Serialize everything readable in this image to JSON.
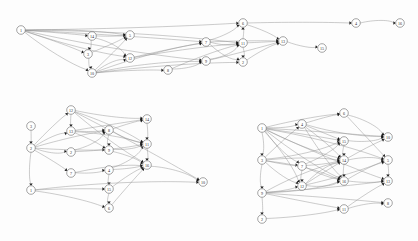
{
  "figure": {
    "background_color": "#fdfdfd",
    "node_fill": "#ffffff",
    "node_stroke": "#4a4a4a",
    "edge_color": "#8d8d8d",
    "arrowhead_color": "#1a1a1a",
    "label_color": "#2b2b2b"
  },
  "graphs": [
    {
      "id": "graph-top",
      "name": "top-graph",
      "nodes": [
        {
          "id": "t1",
          "label": "1",
          "x": 21,
          "y": 30
        },
        {
          "id": "t14",
          "label": "14",
          "x": 92,
          "y": 36
        },
        {
          "id": "t5",
          "label": "5",
          "x": 130,
          "y": 35
        },
        {
          "id": "t3",
          "label": "3",
          "x": 88,
          "y": 54
        },
        {
          "id": "t10",
          "label": "10",
          "x": 92,
          "y": 73
        },
        {
          "id": "t12",
          "label": "12",
          "x": 130,
          "y": 58
        },
        {
          "id": "t8",
          "label": "8",
          "x": 168,
          "y": 70
        },
        {
          "id": "t9",
          "label": "9",
          "x": 206,
          "y": 61
        },
        {
          "id": "t7",
          "label": "7",
          "x": 206,
          "y": 42
        },
        {
          "id": "t6",
          "label": "6",
          "x": 243,
          "y": 23
        },
        {
          "id": "t11",
          "label": "11",
          "x": 243,
          "y": 43
        },
        {
          "id": "t2",
          "label": "2",
          "x": 243,
          "y": 62
        },
        {
          "id": "t13",
          "label": "13",
          "x": 283,
          "y": 41
        },
        {
          "id": "t15",
          "label": "15",
          "x": 322,
          "y": 48
        },
        {
          "id": "t4",
          "label": "4",
          "x": 356,
          "y": 23
        },
        {
          "id": "t16",
          "label": "16",
          "x": 400,
          "y": 23
        }
      ],
      "edges": [
        {
          "from": "t1",
          "to": "t14"
        },
        {
          "from": "t1",
          "to": "t3"
        },
        {
          "from": "t1",
          "to": "t10"
        },
        {
          "from": "t1",
          "to": "t5"
        },
        {
          "from": "t1",
          "to": "t12"
        },
        {
          "from": "t1",
          "to": "t6"
        },
        {
          "from": "t1",
          "to": "t11"
        },
        {
          "from": "t1",
          "to": "t9"
        },
        {
          "from": "t1",
          "to": "t7"
        },
        {
          "from": "t14",
          "to": "t3"
        },
        {
          "from": "t14",
          "to": "t5"
        },
        {
          "from": "t14",
          "to": "t12"
        },
        {
          "from": "t3",
          "to": "t10"
        },
        {
          "from": "t3",
          "to": "t5"
        },
        {
          "from": "t10",
          "to": "t5"
        },
        {
          "from": "t10",
          "to": "t12"
        },
        {
          "from": "t10",
          "to": "t8"
        },
        {
          "from": "t10",
          "to": "t9"
        },
        {
          "from": "t10",
          "to": "t7"
        },
        {
          "from": "t10",
          "to": "t2"
        },
        {
          "from": "t12",
          "to": "t7"
        },
        {
          "from": "t12",
          "to": "t11"
        },
        {
          "from": "t8",
          "to": "t9"
        },
        {
          "from": "t8",
          "to": "t11"
        },
        {
          "from": "t9",
          "to": "t11"
        },
        {
          "from": "t9",
          "to": "t13"
        },
        {
          "from": "t7",
          "to": "t6"
        },
        {
          "from": "t7",
          "to": "t11"
        },
        {
          "from": "t7",
          "to": "t2"
        },
        {
          "from": "t7",
          "to": "t13"
        },
        {
          "from": "t6",
          "to": "t13"
        },
        {
          "from": "t6",
          "to": "t4"
        },
        {
          "from": "t11",
          "to": "t6"
        },
        {
          "from": "t11",
          "to": "t2"
        },
        {
          "from": "t11",
          "to": "t13"
        },
        {
          "from": "t2",
          "to": "t13"
        },
        {
          "from": "t13",
          "to": "t15"
        },
        {
          "from": "t4",
          "to": "t16"
        }
      ]
    },
    {
      "id": "graph-bottom-left",
      "name": "bottom-left-graph",
      "nodes": [
        {
          "id": "b3",
          "label": "3",
          "x": 31,
          "y": 126
        },
        {
          "id": "b2",
          "label": "2",
          "x": 31,
          "y": 148
        },
        {
          "id": "b1",
          "label": "1",
          "x": 31,
          "y": 190
        },
        {
          "id": "b12",
          "label": "12",
          "x": 71,
          "y": 110
        },
        {
          "id": "b13",
          "label": "13",
          "x": 71,
          "y": 131
        },
        {
          "id": "b2b",
          "label": "2",
          "x": 71,
          "y": 152
        },
        {
          "id": "b7",
          "label": "7",
          "x": 71,
          "y": 173
        },
        {
          "id": "b8",
          "label": "8",
          "x": 109,
          "y": 130
        },
        {
          "id": "b9",
          "label": "9",
          "x": 109,
          "y": 150
        },
        {
          "id": "b4",
          "label": "4",
          "x": 109,
          "y": 170
        },
        {
          "id": "b15",
          "label": "15",
          "x": 109,
          "y": 189
        },
        {
          "id": "b6",
          "label": "6",
          "x": 109,
          "y": 208
        },
        {
          "id": "b14",
          "label": "14",
          "x": 147,
          "y": 119
        },
        {
          "id": "b11",
          "label": "11",
          "x": 147,
          "y": 144
        },
        {
          "id": "b16",
          "label": "16",
          "x": 147,
          "y": 165
        },
        {
          "id": "b10",
          "label": "10",
          "x": 203,
          "y": 182
        }
      ],
      "edges": [
        {
          "from": "b3",
          "to": "b2"
        },
        {
          "from": "b2",
          "to": "b1"
        },
        {
          "from": "b2",
          "to": "b12"
        },
        {
          "from": "b2",
          "to": "b13"
        },
        {
          "from": "b2",
          "to": "b2b"
        },
        {
          "from": "b2",
          "to": "b7"
        },
        {
          "from": "b2",
          "to": "b8"
        },
        {
          "from": "b2",
          "to": "b9"
        },
        {
          "from": "b12",
          "to": "b13"
        },
        {
          "from": "b12",
          "to": "b14"
        },
        {
          "from": "b12",
          "to": "b11"
        },
        {
          "from": "b12",
          "to": "b16"
        },
        {
          "from": "b13",
          "to": "b8"
        },
        {
          "from": "b13",
          "to": "b9"
        },
        {
          "from": "b13",
          "to": "b14"
        },
        {
          "from": "b13",
          "to": "b11"
        },
        {
          "from": "b2b",
          "to": "b8"
        },
        {
          "from": "b2b",
          "to": "b11"
        },
        {
          "from": "b7",
          "to": "b4"
        },
        {
          "from": "b7",
          "to": "b16"
        },
        {
          "from": "b8",
          "to": "b9"
        },
        {
          "from": "b8",
          "to": "b14"
        },
        {
          "from": "b8",
          "to": "b11"
        },
        {
          "from": "b9",
          "to": "b11"
        },
        {
          "from": "b9",
          "to": "b16"
        },
        {
          "from": "b4",
          "to": "b15"
        },
        {
          "from": "b4",
          "to": "b11"
        },
        {
          "from": "b4",
          "to": "b16"
        },
        {
          "from": "b15",
          "to": "b6"
        },
        {
          "from": "b15",
          "to": "b16"
        },
        {
          "from": "b6",
          "to": "b16"
        },
        {
          "from": "b1",
          "to": "b6"
        },
        {
          "from": "b1",
          "to": "b15"
        },
        {
          "from": "b1",
          "to": "b10"
        },
        {
          "from": "b14",
          "to": "b11"
        },
        {
          "from": "b11",
          "to": "b16"
        },
        {
          "from": "b16",
          "to": "b10"
        },
        {
          "from": "b12",
          "to": "b10"
        }
      ]
    },
    {
      "id": "graph-bottom-right",
      "name": "bottom-right-graph",
      "nodes": [
        {
          "id": "c1",
          "label": "1",
          "x": 262,
          "y": 128
        },
        {
          "id": "c3",
          "label": "3",
          "x": 262,
          "y": 160
        },
        {
          "id": "c9",
          "label": "9",
          "x": 262,
          "y": 193
        },
        {
          "id": "c2",
          "label": "2",
          "x": 262,
          "y": 219
        },
        {
          "id": "c4",
          "label": "4",
          "x": 302,
          "y": 124
        },
        {
          "id": "c7",
          "label": "7",
          "x": 302,
          "y": 166
        },
        {
          "id": "c12",
          "label": "12",
          "x": 302,
          "y": 186
        },
        {
          "id": "c6",
          "label": "6",
          "x": 344,
          "y": 113
        },
        {
          "id": "c15",
          "label": "15",
          "x": 344,
          "y": 141
        },
        {
          "id": "c14",
          "label": "14",
          "x": 344,
          "y": 160
        },
        {
          "id": "c16",
          "label": "16",
          "x": 344,
          "y": 181
        },
        {
          "id": "c11",
          "label": "11",
          "x": 344,
          "y": 209
        },
        {
          "id": "c10",
          "label": "10",
          "x": 388,
          "y": 137
        },
        {
          "id": "c5",
          "label": "5",
          "x": 388,
          "y": 160
        },
        {
          "id": "c13",
          "label": "13",
          "x": 388,
          "y": 181
        },
        {
          "id": "c8",
          "label": "8",
          "x": 388,
          "y": 203
        }
      ],
      "edges": [
        {
          "from": "c1",
          "to": "c3"
        },
        {
          "from": "c3",
          "to": "c9"
        },
        {
          "from": "c9",
          "to": "c2"
        },
        {
          "from": "c1",
          "to": "c4"
        },
        {
          "from": "c1",
          "to": "c7"
        },
        {
          "from": "c1",
          "to": "c12"
        },
        {
          "from": "c1",
          "to": "c6"
        },
        {
          "from": "c1",
          "to": "c15"
        },
        {
          "from": "c1",
          "to": "c14"
        },
        {
          "from": "c1",
          "to": "c16"
        },
        {
          "from": "c1",
          "to": "c10"
        },
        {
          "from": "c1",
          "to": "c5"
        },
        {
          "from": "c1",
          "to": "c13"
        },
        {
          "from": "c3",
          "to": "c4"
        },
        {
          "from": "c3",
          "to": "c7"
        },
        {
          "from": "c3",
          "to": "c12"
        },
        {
          "from": "c3",
          "to": "c15"
        },
        {
          "from": "c3",
          "to": "c14"
        },
        {
          "from": "c3",
          "to": "c16"
        },
        {
          "from": "c9",
          "to": "c12"
        },
        {
          "from": "c9",
          "to": "c16"
        },
        {
          "from": "c9",
          "to": "c11"
        },
        {
          "from": "c9",
          "to": "c14"
        },
        {
          "from": "c9",
          "to": "c13"
        },
        {
          "from": "c9",
          "to": "c8"
        },
        {
          "from": "c4",
          "to": "c6"
        },
        {
          "from": "c4",
          "to": "c15"
        },
        {
          "from": "c4",
          "to": "c14"
        },
        {
          "from": "c4",
          "to": "c16"
        },
        {
          "from": "c4",
          "to": "c10"
        },
        {
          "from": "c7",
          "to": "c12"
        },
        {
          "from": "c7",
          "to": "c14"
        },
        {
          "from": "c7",
          "to": "c16"
        },
        {
          "from": "c7",
          "to": "c15"
        },
        {
          "from": "c12",
          "to": "c16"
        },
        {
          "from": "c12",
          "to": "c14"
        },
        {
          "from": "c12",
          "to": "c10"
        },
        {
          "from": "c12",
          "to": "c5"
        },
        {
          "from": "c6",
          "to": "c10"
        },
        {
          "from": "c6",
          "to": "c5"
        },
        {
          "from": "c15",
          "to": "c14"
        },
        {
          "from": "c15",
          "to": "c10"
        },
        {
          "from": "c14",
          "to": "c16"
        },
        {
          "from": "c14",
          "to": "c5"
        },
        {
          "from": "c16",
          "to": "c13"
        },
        {
          "from": "c16",
          "to": "c5"
        },
        {
          "from": "c11",
          "to": "c13"
        },
        {
          "from": "c11",
          "to": "c8"
        },
        {
          "from": "c5",
          "to": "c13"
        },
        {
          "from": "c2",
          "to": "c11"
        }
      ]
    }
  ]
}
